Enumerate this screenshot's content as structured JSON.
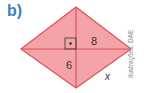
{
  "item_label": "b)",
  "figure": {
    "shape": "rhombus",
    "fill_color": "#f4a3a8",
    "stroke_color": "#e0505e",
    "half_diagonal_vertical": "6",
    "half_diagonal_horizontal": "8",
    "side_label": "x",
    "right_angle_marker": true
  },
  "credit": "Ilustrações: DAE"
}
